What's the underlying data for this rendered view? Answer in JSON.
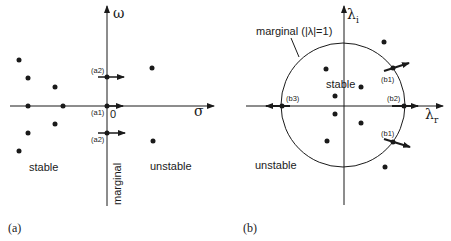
{
  "panel_a": {
    "label": "(a)",
    "x_axis_label": "σ",
    "y_axis_label": "ω",
    "origin_label": "0",
    "region_labels": {
      "left": "stable",
      "right": "unstable",
      "axis": "marginal"
    },
    "points_stable": [
      [
        19,
        60
      ],
      [
        28,
        78
      ],
      [
        55,
        87
      ],
      [
        28,
        106
      ],
      [
        63,
        106
      ],
      [
        55,
        124
      ],
      [
        28,
        133
      ],
      [
        19,
        151
      ]
    ],
    "points_unstable": [
      [
        152,
        68
      ],
      [
        153,
        141
      ]
    ],
    "crossing_points": [
      {
        "label": "(a2)",
        "x": 107,
        "y": 76
      },
      {
        "label": "(a1)",
        "x": 107,
        "y": 106
      },
      {
        "label": "(a2)",
        "x": 107,
        "y": 133
      }
    ]
  },
  "panel_b": {
    "label": "(b)",
    "x_axis_label_main": "λ",
    "x_axis_label_sub": "r",
    "y_axis_label_main": "λ",
    "y_axis_label_sub": "i",
    "circle_label": "marginal (|λ|=1)",
    "region_labels": {
      "inside": "stable",
      "outside": "unstable"
    },
    "points_inside": [
      [
        326,
        69
      ],
      [
        361,
        87
      ],
      [
        335,
        96
      ],
      [
        335,
        114
      ],
      [
        361,
        123
      ],
      [
        327,
        141
      ]
    ],
    "points_outside": [
      [
        384,
        42
      ],
      [
        385,
        167
      ]
    ],
    "crossing_points": [
      {
        "label": "(b1)",
        "x": 393,
        "y": 68
      },
      {
        "label": "(b2)",
        "x": 404,
        "y": 106
      },
      {
        "label": "(b3)",
        "x": 282,
        "y": 106
      },
      {
        "label": "(b1)",
        "x": 393,
        "y": 142
      }
    ]
  }
}
